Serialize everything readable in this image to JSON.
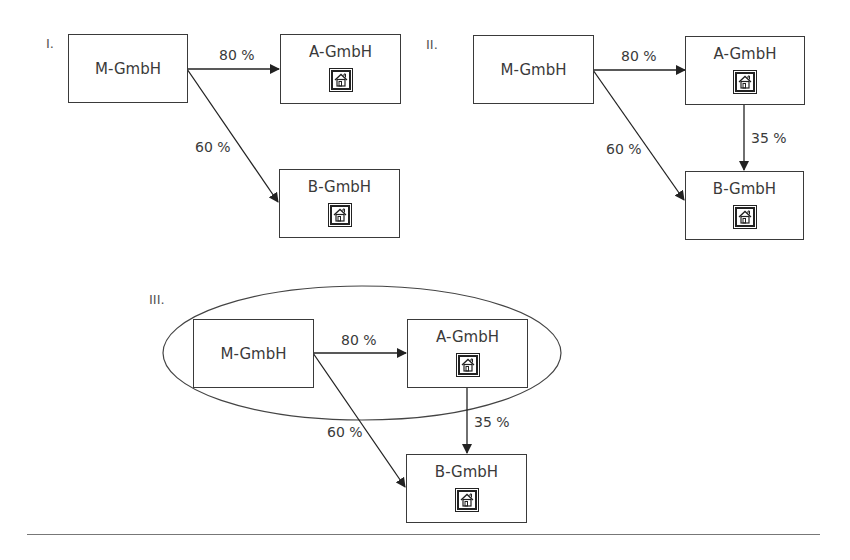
{
  "diagrams": [
    {
      "label": "I.",
      "parent": "M-GmbH",
      "sub_a": "A-GmbH",
      "sub_b": "B-GmbH",
      "edge_m_a": "80 %",
      "edge_m_b": "60 %"
    },
    {
      "label": "II.",
      "parent": "M-GmbH",
      "sub_a": "A-GmbH",
      "sub_b": "B-GmbH",
      "edge_m_a": "80 %",
      "edge_m_b": "60 %",
      "edge_a_b": "35 %"
    },
    {
      "label": "III.",
      "parent": "M-GmbH",
      "sub_a": "A-GmbH",
      "sub_b": "B-GmbH",
      "edge_m_a": "80 %",
      "edge_m_b": "60 %",
      "edge_a_b": "35 %",
      "grouping": "ellipse enclosing M-GmbH and A-GmbH"
    }
  ],
  "icons": {
    "subsidiary_icon": "house-icon"
  },
  "colors": {
    "stroke": "#3a3a3a",
    "text": "#3a3a3a",
    "rule": "#777777"
  }
}
